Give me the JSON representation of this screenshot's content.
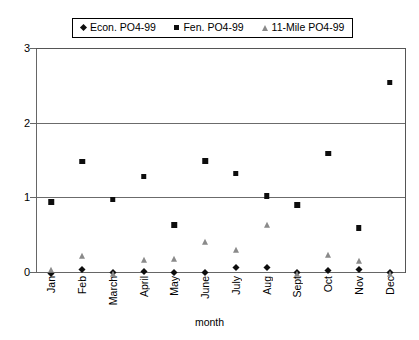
{
  "chart_data": {
    "type": "scatter",
    "title": "",
    "xlabel": "month",
    "ylabel": "",
    "ylim": [
      0,
      3
    ],
    "yticks": [
      "0",
      "1",
      "2",
      "3"
    ],
    "grid": true,
    "legend_position": "top",
    "categories": [
      "Jan",
      "Feb",
      "March",
      "April",
      "May",
      "June",
      "July",
      "Aug",
      "Sept",
      "Oct",
      "Nov",
      "Dec"
    ],
    "series": [
      {
        "name": "Econ. PO4-99",
        "marker": "diamond",
        "color": "#0d0d0d",
        "values": [
          0.02,
          0.07,
          0.03,
          0.04,
          0.03,
          0.03,
          0.09,
          0.1,
          0.03,
          0.05,
          0.07,
          0.03
        ]
      },
      {
        "name": "Fen. PO4-99",
        "marker": "square",
        "color": "#0d0d0d",
        "values": [
          0.97,
          1.51,
          1.0,
          1.31,
          0.66,
          1.52,
          1.35,
          1.05,
          0.93,
          1.62,
          0.62,
          2.57
        ]
      },
      {
        "name": "11-Mile PO4-99",
        "marker": "triangle",
        "color": "#8a8a8a",
        "values": [
          0.08,
          0.27,
          0.03,
          0.22,
          0.23,
          0.45,
          0.35,
          0.68,
          0.03,
          0.28,
          0.2,
          0.03
        ]
      }
    ]
  },
  "legend": {
    "entries": [
      {
        "label": "Econ. PO4-99",
        "marker": "diamond"
      },
      {
        "label": "Fen. PO4-99",
        "marker": "square"
      },
      {
        "label": "11-Mile PO4-99",
        "marker": "triangle"
      }
    ]
  },
  "axis": {
    "x_title": "month"
  }
}
